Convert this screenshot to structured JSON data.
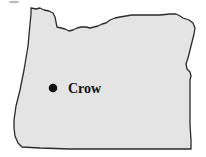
{
  "map": {
    "region": "Oregon",
    "fill_color": "#e4e4e4",
    "outline_color": "#2a2a2a",
    "cities": [
      {
        "name": "Crow",
        "marker": "filled-circle-icon",
        "x": 53,
        "y": 88
      }
    ]
  }
}
